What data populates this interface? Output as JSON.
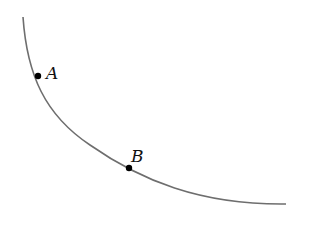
{
  "diagram": {
    "curve": {
      "stroke": "#6e6e6e",
      "path": "M23,17 C27,75 45,115 90,145 C140,180 200,205 286,204"
    },
    "points": [
      {
        "label": "A",
        "x": 38,
        "y": 76,
        "label_x": 46,
        "label_y": 79
      },
      {
        "label": "B",
        "x": 129,
        "y": 168,
        "label_x": 131,
        "label_y": 162
      }
    ]
  }
}
